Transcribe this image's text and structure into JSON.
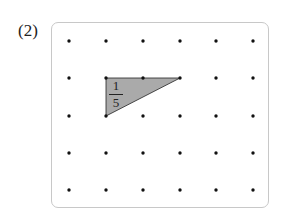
{
  "problem_label": "(2)",
  "grid": {
    "columns_x": [
      69,
      106,
      143,
      180,
      216,
      253
    ],
    "rows_y": [
      41,
      78,
      116,
      153,
      190
    ],
    "dot_color": "#111111",
    "frame_color": "#c8c8c8"
  },
  "shaded_triangle": {
    "vertices": [
      [
        106,
        78
      ],
      [
        180,
        78
      ],
      [
        106,
        116
      ]
    ],
    "fill": "#aaaaaa",
    "stroke": "#222222",
    "fraction": {
      "numerator": "1",
      "denominator": "5"
    }
  }
}
